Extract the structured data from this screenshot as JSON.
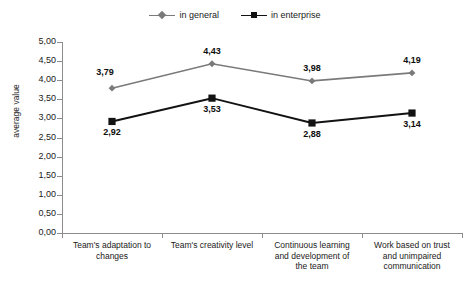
{
  "chart_data": {
    "type": "line",
    "title": "",
    "xlabel": "",
    "ylabel": "average value",
    "ylim": [
      0,
      5
    ],
    "ytick_step": 0.5,
    "grid": false,
    "legend_position": "top-center",
    "decimal_separator": ",",
    "categories": [
      "Team's adaptation to changes",
      "Team's creativity level",
      "Continuous learning and development of the team",
      "Work based on trust and unimpaired communication"
    ],
    "ytick_labels": [
      "5,00",
      "4,50",
      "4,00",
      "3,50",
      "3,00",
      "2,50",
      "2,00",
      "1,50",
      "1,00",
      "0,50",
      "0,00"
    ],
    "ytick_values": [
      5,
      4.5,
      4,
      3.5,
      3,
      2.5,
      2,
      1.5,
      1,
      0.5,
      0
    ],
    "series": [
      {
        "name": "in general",
        "marker": "diamond",
        "color": "#7a7a7a",
        "values": [
          3.79,
          4.43,
          3.98,
          4.19
        ],
        "labels": [
          "3,79",
          "4,43",
          "3,98",
          "4,19"
        ],
        "label_position": [
          "above-left",
          "above",
          "above",
          "above"
        ]
      },
      {
        "name": "in enterprise",
        "marker": "square",
        "color": "#121212",
        "values": [
          2.92,
          3.53,
          2.88,
          3.14
        ],
        "labels": [
          "2,92",
          "3,53",
          "2,88",
          "3,14"
        ],
        "label_position": [
          "below",
          "below",
          "below",
          "below"
        ]
      }
    ]
  },
  "legend": {
    "entries": [
      {
        "label": "in general"
      },
      {
        "label": "in enterprise"
      }
    ]
  },
  "axes": {
    "y_title": "average value"
  },
  "labels": {
    "cat0_line1": "Team's adaptation to",
    "cat0_line2": "changes",
    "cat1_line1": "Team's creativity level",
    "cat2_line1": "Continuous learning",
    "cat2_line2": "and development of",
    "cat2_line3": "the team",
    "cat3_line1": "Work based on trust",
    "cat3_line2": "and unimpaired",
    "cat3_line3": "communication"
  }
}
